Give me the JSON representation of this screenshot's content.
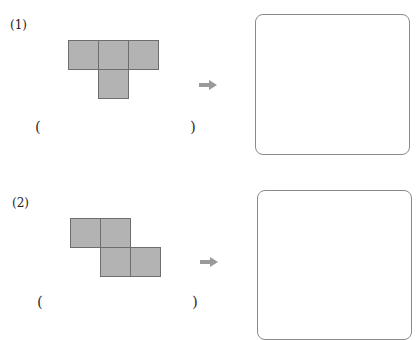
{
  "problems": [
    {
      "number_label": "(1)",
      "shape": "T-tetromino",
      "open_paren": "(",
      "close_paren": ")",
      "answer": ""
    },
    {
      "number_label": "(2)",
      "shape": "Z-tetromino",
      "open_paren": "(",
      "close_paren": ")",
      "answer": ""
    }
  ],
  "colors": {
    "square_fill": "#b3b3b3",
    "square_border": "#6e6e6e",
    "arrow": "#9a9a9a",
    "box_border": "#8a8a8a"
  },
  "icons": {
    "arrow": "right-arrow-icon"
  }
}
